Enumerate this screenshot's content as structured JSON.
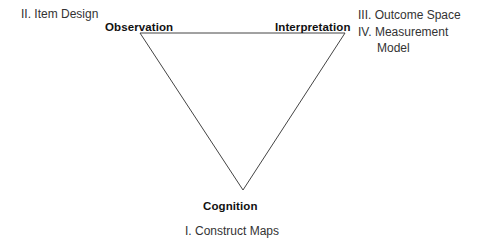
{
  "figure": {
    "background_color": "#ffffff",
    "line_color": "#444444"
  },
  "triangle": {
    "name": "inverted-triangle",
    "vertices": {
      "top_left": {
        "x": 140,
        "y": 33
      },
      "top_right": {
        "x": 345,
        "y": 33
      },
      "bottom": {
        "x": 243,
        "y": 190
      }
    }
  },
  "vertex_labels": {
    "observation": "Observation",
    "interpretation": "Interpretation",
    "cognition": "Cognition"
  },
  "notes": {
    "item_design": "II. Item Design",
    "construct_maps": "I. Construct Maps",
    "right_block": [
      {
        "text": "III. Outcome Space",
        "indented": false
      },
      {
        "text": "IV. Measurement",
        "indented": false
      },
      {
        "text": "Model",
        "indented": true
      }
    ]
  }
}
